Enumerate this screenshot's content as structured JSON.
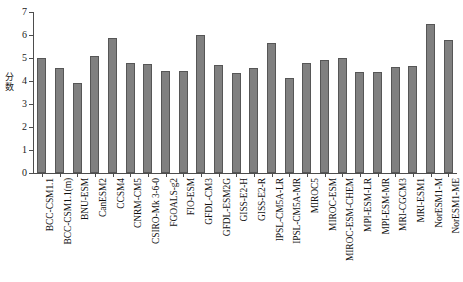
{
  "chart_data": {
    "type": "bar",
    "title": "",
    "xlabel": "",
    "ylabel": "分数",
    "ylim": [
      0,
      7
    ],
    "yticks": [
      0,
      1,
      2,
      3,
      4,
      5,
      6,
      7
    ],
    "ytick_labels": [
      "0",
      "1",
      "2",
      "3",
      "4",
      "5",
      "6",
      "7"
    ],
    "grid": false,
    "legend": null,
    "bar_color": "#808080",
    "bar_edge_color": "#565656",
    "categories": [
      "BCC-CSM1.1",
      "BCC-CSM1.1(m)",
      "BNU-ESM",
      "CanESM2",
      "CCSM4",
      "CNRM-CM5",
      "CSIRO-Mk 3-6-0",
      "FGOALS-g2",
      "FIO-ESM",
      "GFDL-CM3",
      "GFDL-ESM2G",
      "GISS-E2-H",
      "GISS-E2-R",
      "IPSL-CM5A-LR",
      "IPSL-CM5A-MR",
      "MIROC5",
      "MIROC-ESM",
      "MIROC-ESM-CHEM",
      "MPI-ESM-LR",
      "MPI-ESM-MR",
      "MRI-CGCM3",
      "MRI-ESM1",
      "NorESM1-M",
      "NorESM1-ME"
    ],
    "values": [
      5.0,
      4.55,
      3.9,
      5.1,
      5.85,
      4.8,
      4.75,
      4.45,
      4.45,
      6.0,
      4.7,
      4.35,
      4.55,
      5.65,
      4.15,
      4.8,
      4.9,
      5.0,
      4.4,
      4.4,
      4.6,
      4.65,
      6.5,
      5.8
    ]
  }
}
